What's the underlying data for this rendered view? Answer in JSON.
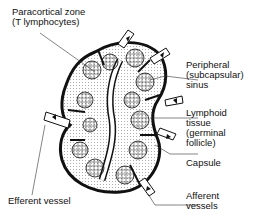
{
  "diagram": {
    "labels": {
      "paracortical_zone_1": "Paracortical zone",
      "paracortical_zone_2": "(T lymphocytes)",
      "peripheral_sinus_1": "Peripheral",
      "peripheral_sinus_2": "(subcapsular)",
      "peripheral_sinus_3": "sinus",
      "lymphoid_tissue_1": "Lymphoid",
      "lymphoid_tissue_2": "tissue",
      "lymphoid_tissue_3": "(germinal",
      "lymphoid_tissue_4": "follicle)",
      "capsule": "Capsule",
      "efferent_vessel": "Efferent vessel",
      "afferent_vessels_1": "Afferent",
      "afferent_vessels_2": "vessels"
    },
    "colors": {
      "ink": "#111111",
      "background": "#ffffff"
    }
  }
}
